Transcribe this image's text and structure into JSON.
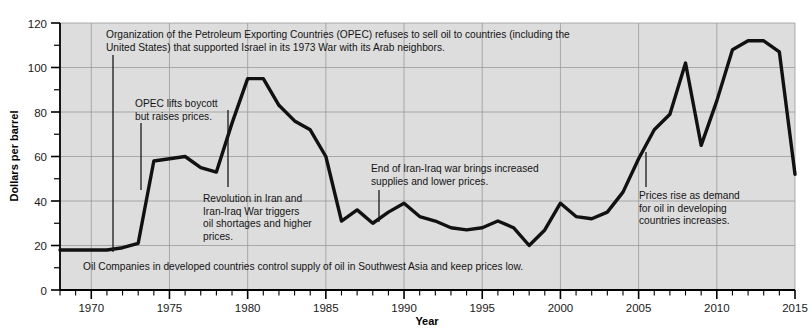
{
  "chart_data": {
    "type": "line",
    "title": "",
    "subtitle": "",
    "xlabel": "Year",
    "ylabel": "Dollars per barrel",
    "xlim": [
      1968,
      2015
    ],
    "ylim": [
      0,
      120
    ],
    "xticks": [
      1970,
      1975,
      1980,
      1985,
      1990,
      1995,
      2000,
      2005,
      2010,
      2015
    ],
    "xtick_labels": [
      "1970",
      "1975",
      "1980",
      "1985",
      "1990",
      "1995",
      "2000",
      "2005",
      "2010",
      "2015"
    ],
    "yticks": [
      0,
      20,
      40,
      60,
      80,
      100,
      120
    ],
    "ytick_labels": [
      "0",
      "20",
      "40",
      "60",
      "80",
      "100",
      "120"
    ],
    "minor_ytick_step": 10,
    "minor_xtick_step": 1,
    "grid": true,
    "legend": false,
    "legend_position": "none",
    "plot_bgcolor": "#dddddd",
    "line_color": "#111111",
    "x": [
      1968,
      1969,
      1970,
      1971,
      1972,
      1973,
      1974,
      1975,
      1976,
      1977,
      1978,
      1979,
      1980,
      1981,
      1982,
      1983,
      1984,
      1985,
      1986,
      1987,
      1988,
      1989,
      1990,
      1991,
      1992,
      1993,
      1994,
      1995,
      1996,
      1997,
      1998,
      1999,
      2000,
      2001,
      2002,
      2003,
      2004,
      2005,
      2006,
      2007,
      2008,
      2009,
      2010,
      2011,
      2012,
      2013,
      2014,
      2015
    ],
    "values": [
      18,
      18,
      18,
      18,
      19,
      21,
      58,
      59,
      60,
      55,
      53,
      75,
      95,
      95,
      83,
      76,
      72,
      60,
      31,
      36,
      30,
      35,
      39,
      33,
      31,
      28,
      27,
      28,
      31,
      28,
      20,
      27,
      39,
      33,
      32,
      35,
      44,
      59,
      72,
      79,
      102,
      65,
      85,
      108,
      112,
      112,
      107,
      52
    ],
    "series": [
      {
        "name": "Crude oil price",
        "values": [
          18,
          18,
          18,
          18,
          19,
          21,
          58,
          59,
          60,
          55,
          53,
          75,
          95,
          95,
          83,
          76,
          72,
          60,
          31,
          36,
          30,
          35,
          39,
          33,
          31,
          28,
          27,
          28,
          31,
          28,
          20,
          27,
          39,
          33,
          32,
          35,
          44,
          59,
          72,
          79,
          102,
          65,
          85,
          108,
          112,
          112,
          107,
          52
        ]
      }
    ],
    "annotations": [
      {
        "id": "opec-embargo",
        "lines": [
          "Organization of the Petroleum Exporting Countries (OPEC) refuses to sell oil to countries (including the",
          "United States) that supported Israel in its 1973 War with its Arab neighbors."
        ],
        "anchor_year": 1972.6,
        "anchor_value": 19
      },
      {
        "id": "opec-lifts-boycott",
        "lines": [
          "OPEC lifts boycott",
          "but raises prices."
        ],
        "anchor_year": 1974.2,
        "anchor_value": 57
      },
      {
        "id": "iran-revolution",
        "lines": [
          "Revolution in Iran and",
          "Iran-Iraq War triggers",
          "oil shortages and higher",
          "prices."
        ],
        "anchor_year": 1979.9,
        "anchor_value": 95
      },
      {
        "id": "iran-iraq-war-end",
        "lines": [
          "End of Iran-Iraq war brings increased",
          "supplies and lower prices."
        ],
        "anchor_year": 1988.4,
        "anchor_value": 31
      },
      {
        "id": "developing-demand",
        "lines": [
          "Prices rise as demand",
          "for oil in developing",
          "countries increases."
        ],
        "anchor_year": 2005.6,
        "anchor_value": 62
      },
      {
        "id": "oil-companies-control",
        "lines": [
          "Oil Companies in developed countries control supply of oil in Southwest Asia and keep prices low."
        ],
        "anchor_year": 1969.3,
        "anchor_value": 18
      }
    ]
  }
}
